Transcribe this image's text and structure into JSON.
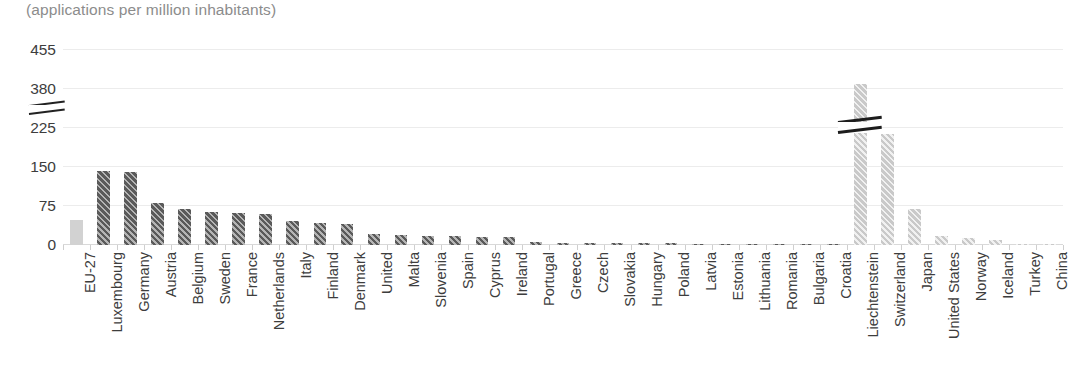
{
  "subtitle": "(applications per million inhabitants)",
  "colors": {
    "eu_aggregate": "#d2d2d2",
    "eu_member": "#5a5a5a",
    "non_eu": "#c9c9c9",
    "gridline": "#ececec",
    "axis_text": "#3d3d3d",
    "subtitle_text": "#8c8c8c"
  },
  "axis": {
    "y_ticks": [
      "0",
      "75",
      "150",
      "225",
      "380",
      "455"
    ],
    "y_break_between": [
      "225",
      "380"
    ],
    "grid": true,
    "legend": "none"
  },
  "chart_data": {
    "type": "bar",
    "title": "",
    "subtitle": "(applications per million inhabitants)",
    "xlabel": "",
    "ylabel": "",
    "ylim": [
      0,
      455
    ],
    "y_ticks": [
      0,
      75,
      150,
      225,
      380,
      455
    ],
    "axis_break": {
      "present": true,
      "between": [
        225,
        380
      ],
      "note": "y-axis is broken between 225 and 380; Liechtenstein bar is clipped by the break"
    },
    "grid": true,
    "legend_position": "none",
    "categories": [
      "EU-27",
      "Luxembourg",
      "Germany",
      "Austria",
      "Belgium",
      "Sweden",
      "France",
      "Netherlands",
      "Italy",
      "Finland",
      "Denmark",
      "United",
      "Malta",
      "Slovenia",
      "Spain",
      "Cyprus",
      "Ireland",
      "Portugal",
      "Greece",
      "Czech",
      "Slovakia",
      "Hungary",
      "Poland",
      "Latvia",
      "Estonia",
      "Lithuania",
      "Romania",
      "Bulgaria",
      "Croatia",
      "Liechtenstein",
      "Switzerland",
      "Japan",
      "United States",
      "Norway",
      "Iceland",
      "Turkey",
      "China"
    ],
    "values": [
      48,
      143,
      140,
      80,
      70,
      64,
      61,
      60,
      46,
      42,
      41,
      22,
      20,
      18,
      17,
      16,
      15,
      5,
      4,
      4,
      3,
      3,
      3,
      2,
      2,
      2,
      1,
      1,
      1,
      390,
      214,
      70,
      17,
      14,
      9,
      1,
      1
    ],
    "series_groups": [
      {
        "name": "EU aggregate",
        "style": "solid light gray",
        "indices": [
          0
        ]
      },
      {
        "name": "EU member states",
        "style": "dark gray diagonal hatch",
        "indices": [
          1,
          2,
          3,
          4,
          5,
          6,
          7,
          8,
          9,
          10,
          11,
          12,
          13,
          14,
          15,
          16,
          17,
          18,
          19,
          20,
          21,
          22,
          23,
          24,
          25,
          26,
          27,
          28
        ]
      },
      {
        "name": "Non-EU countries",
        "style": "light gray diagonal hatch",
        "indices": [
          29,
          30,
          31,
          32,
          33,
          34,
          35,
          36
        ]
      }
    ]
  }
}
